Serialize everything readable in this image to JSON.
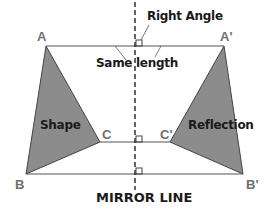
{
  "colors": {
    "shape_fill": "#8c8c8c",
    "line": "#555555",
    "mirror_line": "#222222",
    "vertex_label": "#6f6f6f",
    "text": "#1a1a1a"
  },
  "labels": {
    "right_angle": "Right Angle",
    "same_length": "Same length",
    "shape": "Shape",
    "reflection": "Reflection",
    "mirror_line": "MIRROR LINE"
  },
  "vertices": {
    "A": "A",
    "B": "B",
    "C": "C",
    "A_prime": "A'",
    "B_prime": "B'",
    "C_prime": "C'"
  },
  "geometry": {
    "mirror_x": 135,
    "A": [
      46,
      46
    ],
    "B": [
      26,
      174
    ],
    "C": [
      100,
      142
    ],
    "A_prime": [
      224,
      46
    ],
    "B_prime": [
      243,
      174
    ],
    "C_prime": [
      170,
      142
    ]
  }
}
